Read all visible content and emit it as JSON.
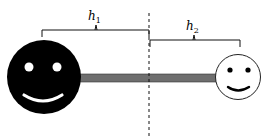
{
  "diagram": {
    "labels": {
      "h1": {
        "base": "h",
        "sub": "1"
      },
      "h2": {
        "base": "h",
        "sub": "2"
      }
    },
    "colors": {
      "large_face": "#000000",
      "small_face": "#ffffff",
      "bar": "#6e6e6e",
      "line": "#000000"
    },
    "elements": [
      "large-black-smiley",
      "small-white-smiley",
      "connecting-bar",
      "dashed-divider",
      "bracket-h1",
      "bracket-h2"
    ]
  }
}
